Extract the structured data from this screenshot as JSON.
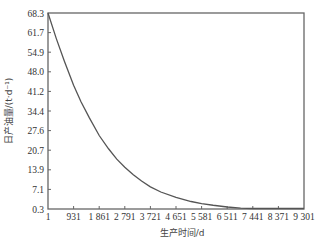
{
  "chart_data": {
    "type": "line",
    "title": "",
    "xlabel": "生产时间/d",
    "ylabel": "日产油量/(t·d⁻¹)",
    "xlim": [
      1,
      9301
    ],
    "ylim": [
      0.3,
      68.3
    ],
    "grid": false,
    "legend": null,
    "x_ticks": [
      "1",
      "931",
      "1 861",
      "2 791",
      "3 721",
      "4 651",
      "5 581",
      "6 511",
      "7 441",
      "8 371",
      "9 301"
    ],
    "x_tick_values": [
      1,
      931,
      1861,
      2791,
      3721,
      4651,
      5581,
      6511,
      7441,
      8371,
      9301
    ],
    "y_ticks": [
      "0.3",
      "7.1",
      "13.9",
      "20.7",
      "27.6",
      "34.4",
      "41.2",
      "48.0",
      "54.9",
      "61.7",
      "68.3"
    ],
    "y_tick_values": [
      0.3,
      7.1,
      13.9,
      20.7,
      27.6,
      34.4,
      41.2,
      48.0,
      54.9,
      61.7,
      68.3
    ],
    "series": [
      {
        "name": "日产油量",
        "color": "#555555",
        "x": [
          1,
          300,
          600,
          931,
          1200,
          1500,
          1861,
          2200,
          2500,
          2791,
          3100,
          3400,
          3721,
          4100,
          4651,
          5200,
          5581,
          6000,
          6511,
          7000,
          7441,
          8000,
          8371,
          9000,
          9301
        ],
        "y": [
          68.3,
          59.5,
          51.5,
          43.2,
          37.5,
          32.0,
          25.8,
          21.2,
          17.6,
          14.8,
          12.2,
          10.0,
          8.0,
          6.2,
          4.3,
          2.9,
          2.2,
          1.6,
          1.0,
          0.6,
          0.4,
          0.3,
          0.3,
          0.3,
          0.3
        ]
      }
    ]
  },
  "axes": {
    "x_title": "生产时间/d",
    "y_title": "日产油量/(t·d⁻¹)"
  },
  "style": {
    "frame_color": "#666666",
    "line_color": "#555555",
    "text_color": "#333333"
  }
}
